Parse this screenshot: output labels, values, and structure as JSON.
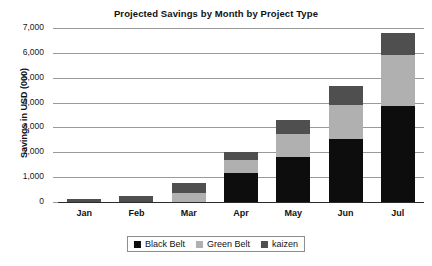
{
  "chart_data": {
    "type": "bar",
    "stacked": true,
    "title": "Projected Savings by Month by Project Type",
    "xlabel": "",
    "ylabel": "Savings in USD (000)",
    "categories": [
      "Jan",
      "Feb",
      "Mar",
      "Apr",
      "May",
      "Jun",
      "Jul"
    ],
    "ylim": [
      0,
      7000
    ],
    "yticks": [
      0,
      1000,
      2000,
      3000,
      4000,
      5000,
      6000,
      7000
    ],
    "ytick_labels": [
      "0",
      "1,000",
      "2,000",
      "3,000",
      "4,000",
      "5,000",
      "6,000",
      "7,000"
    ],
    "grid": true,
    "legend_position": "bottom",
    "series": [
      {
        "name": "Black Belt",
        "color": "#0d0d0d",
        "values": [
          0,
          0,
          0,
          1150,
          1800,
          2550,
          3850
        ]
      },
      {
        "name": "Green Belt",
        "color": "#b0b0b0",
        "values": [
          0,
          0,
          350,
          550,
          950,
          1350,
          2050
        ]
      },
      {
        "name": "kaizen",
        "color": "#4f4f4f",
        "values": [
          120,
          230,
          430,
          300,
          550,
          750,
          900
        ]
      }
    ],
    "totals": [
      120,
      230,
      780,
      2000,
      3300,
      4650,
      6800
    ]
  },
  "legend": {
    "entries": [
      {
        "label": "Black Belt",
        "color": "#0d0d0d"
      },
      {
        "label": "Green Belt",
        "color": "#b0b0b0"
      },
      {
        "label": "kaizen",
        "color": "#4f4f4f"
      }
    ]
  }
}
